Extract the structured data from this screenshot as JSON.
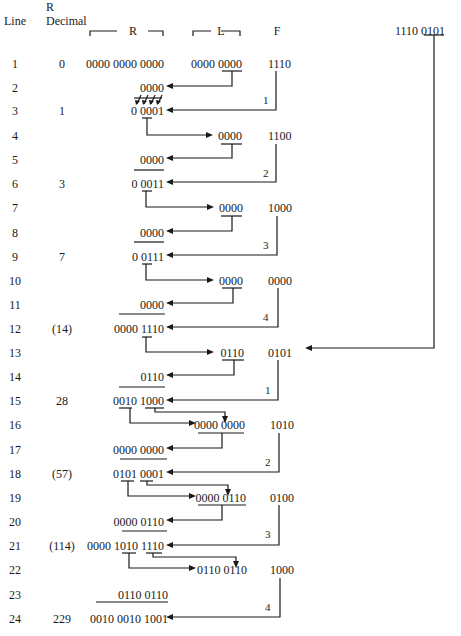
{
  "headers": {
    "line": "Line",
    "r_decimal_top": "R",
    "r_decimal_bottom": "Decimal",
    "r": "R",
    "l": "L",
    "f": "F",
    "source": "1110 0101"
  },
  "rows": [
    {
      "line": "1",
      "dec": "0",
      "r": "0000 0000 0000",
      "l": "0000 0000",
      "f": "1110"
    },
    {
      "line": "2",
      "dec": "",
      "r": "0000",
      "l": "",
      "f": ""
    },
    {
      "line": "3",
      "dec": "1",
      "r": "0 0001",
      "l": "",
      "f": ""
    },
    {
      "line": "4",
      "dec": "",
      "r": "",
      "l": "0000",
      "f": "1100"
    },
    {
      "line": "5",
      "dec": "",
      "r": "0000",
      "l": "",
      "f": ""
    },
    {
      "line": "6",
      "dec": "3",
      "r": "0 0011",
      "l": "",
      "f": ""
    },
    {
      "line": "7",
      "dec": "",
      "r": "",
      "l": "0000",
      "f": "1000"
    },
    {
      "line": "8",
      "dec": "",
      "r": "0000",
      "l": "",
      "f": ""
    },
    {
      "line": "9",
      "dec": "7",
      "r": "0 0111",
      "l": "",
      "f": ""
    },
    {
      "line": "10",
      "dec": "",
      "r": "",
      "l": "0000",
      "f": "0000"
    },
    {
      "line": "11",
      "dec": "",
      "r": "0000",
      "l": "",
      "f": ""
    },
    {
      "line": "12",
      "dec": "(14)",
      "r": "0000 1110",
      "l": "",
      "f": ""
    },
    {
      "line": "13",
      "dec": "",
      "r": "",
      "l": "0110",
      "f": "0101"
    },
    {
      "line": "14",
      "dec": "",
      "r": "0110",
      "l": "",
      "f": ""
    },
    {
      "line": "15",
      "dec": "28",
      "r": "0010 1000",
      "l": "",
      "f": ""
    },
    {
      "line": "16",
      "dec": "",
      "r": "",
      "l": "0000 0000",
      "f": "1010"
    },
    {
      "line": "17",
      "dec": "",
      "r": "0000 0000",
      "l": "",
      "f": ""
    },
    {
      "line": "18",
      "dec": "(57)",
      "r": "0101 0001",
      "l": "",
      "f": ""
    },
    {
      "line": "19",
      "dec": "",
      "r": "",
      "l": "0000 0110",
      "f": "0100"
    },
    {
      "line": "20",
      "dec": "",
      "r": "0000 0110",
      "l": "",
      "f": ""
    },
    {
      "line": "21",
      "dec": "(114)",
      "r": "0000 1010 1110",
      "l": "",
      "f": ""
    },
    {
      "line": "22",
      "dec": "",
      "r": "",
      "l": "0110 0110",
      "f": "1000"
    },
    {
      "line": "23",
      "dec": "",
      "r": "0110 0110",
      "l": "",
      "f": ""
    },
    {
      "line": "24",
      "dec": "229",
      "r": "0010 0010 1001",
      "l": "",
      "f": ""
    }
  ],
  "shift_labels": [
    "1",
    "2",
    "3",
    "4",
    "1",
    "2",
    "3",
    "4"
  ]
}
